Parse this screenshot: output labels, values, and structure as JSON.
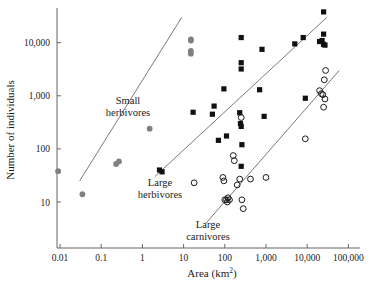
{
  "chart_data": {
    "type": "scatter",
    "title": "",
    "xlabel": "Area (km2)",
    "xlabel_base": "Area (km",
    "xlabel_sup": "2",
    "xlabel_close": ")",
    "ylabel": "Number of individuals",
    "xscale": "log",
    "yscale": "log",
    "xlim": [
      0.003,
      300000
    ],
    "ylim": [
      3,
      60000
    ],
    "grid": false,
    "legend": "inline-annotations",
    "xticks": [
      0.01,
      0.1,
      1,
      10,
      100,
      1000,
      10000,
      100000
    ],
    "xtick_labels": [
      "0.01",
      "0.1",
      "1",
      "10",
      "100",
      "1,000",
      "10,000",
      "100,000"
    ],
    "yticks": [
      10,
      100,
      1000,
      10000
    ],
    "ytick_labels": [
      "10",
      "100",
      "1,000",
      "10,000"
    ],
    "annotations": [
      {
        "name": "small-herbivores",
        "line1": "Small",
        "line2": "herbivores",
        "x_px": 128,
        "y_px": 104
      },
      {
        "name": "large-herbivores",
        "line1": "Large",
        "line2": "herbivores",
        "x_px": 160,
        "y_px": 186
      },
      {
        "name": "large-carnivores",
        "line1": "Large",
        "line2": "carnivores",
        "x_px": 208,
        "y_px": 228
      }
    ],
    "series": [
      {
        "name": "Small herbivores",
        "marker": "filled-circle",
        "color": "#808080",
        "points": [
          [
            0.009,
            38
          ],
          [
            0.035,
            14
          ],
          [
            0.23,
            52
          ],
          [
            0.27,
            58
          ],
          [
            1.5,
            240
          ],
          [
            15,
            11500
          ],
          [
            15,
            11000
          ],
          [
            15,
            7000
          ],
          [
            15,
            6200
          ]
        ],
        "trend_line": {
          "x1": 0.03,
          "y1": 25,
          "x2": 9,
          "y2": 30000
        }
      },
      {
        "name": "Large herbivores",
        "marker": "filled-square",
        "color": "#111111",
        "points": [
          [
            2.6,
            40
          ],
          [
            3.0,
            37
          ],
          [
            17,
            490
          ],
          [
            50,
            450
          ],
          [
            55,
            640
          ],
          [
            70,
            145
          ],
          [
            95,
            1350
          ],
          [
            110,
            175
          ],
          [
            230,
            480
          ],
          [
            240,
            300
          ],
          [
            250,
            265
          ],
          [
            250,
            47
          ],
          [
            250,
            4200
          ],
          [
            250,
            3200
          ],
          [
            250,
            12500
          ],
          [
            260,
            120
          ],
          [
            700,
            1300
          ],
          [
            800,
            7500
          ],
          [
            900,
            410
          ],
          [
            5000,
            9500
          ],
          [
            8000,
            12500
          ],
          [
            9000,
            900
          ],
          [
            20000,
            10500
          ],
          [
            23000,
            11000
          ],
          [
            25000,
            9300
          ],
          [
            27000,
            9000
          ],
          [
            25000,
            14500
          ],
          [
            25000,
            38000
          ]
        ],
        "trend_line": {
          "x1": 2,
          "y1": 30,
          "x2": 30000,
          "y2": 30000
        }
      },
      {
        "name": "Large carnivores",
        "marker": "open-circle",
        "color": "#1a1a1a",
        "points": [
          [
            18,
            23
          ],
          [
            90,
            29
          ],
          [
            95,
            25
          ],
          [
            100,
            11
          ],
          [
            110,
            11
          ],
          [
            115,
            10
          ],
          [
            120,
            12
          ],
          [
            130,
            11
          ],
          [
            160,
            75
          ],
          [
            170,
            60
          ],
          [
            200,
            21
          ],
          [
            230,
            27
          ],
          [
            250,
            390
          ],
          [
            260,
            11
          ],
          [
            280,
            7.5
          ],
          [
            420,
            27
          ],
          [
            1000,
            29
          ],
          [
            9000,
            155
          ],
          [
            20000,
            1250
          ],
          [
            22000,
            1100
          ],
          [
            24000,
            1050
          ],
          [
            25000,
            610
          ],
          [
            26000,
            2000
          ],
          [
            27000,
            870
          ],
          [
            28000,
            3000
          ]
        ],
        "trend_line": {
          "x1": 35,
          "y1": 4,
          "x2": 60000,
          "y2": 3000
        }
      }
    ]
  }
}
